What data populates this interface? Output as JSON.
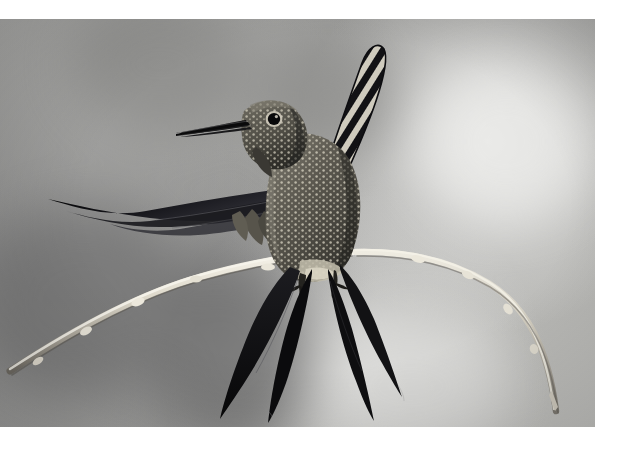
{
  "image": {
    "kind": "photograph",
    "subject": "hummingbird perched on a thin bare twig",
    "orientation": "landscape",
    "palette": "monochrome grayscale",
    "canvas": {
      "width": 624,
      "height": 461,
      "background_color": "#ffffff"
    },
    "photo_frame": {
      "x": 0,
      "y": 19,
      "width": 595,
      "height": 408
    }
  },
  "background": {
    "description": "smooth out-of-focus gray bokeh with soft light and dark patches",
    "base_color": "#a6a6a4",
    "highlight_color": "#ececea",
    "shadow_color": "#6f6f6f",
    "highlight_zones": [
      "upper right",
      "lower center"
    ],
    "shadow_zones": [
      "left",
      "lower left",
      "center bottom"
    ]
  },
  "subject": {
    "name": "hummingbird",
    "pose": "perched with wings raised and spread",
    "body_color": "#4a4842",
    "accent_color": "#0d0d0e",
    "plumage_highlight": "#ded9c8",
    "parts": [
      {
        "label": "beak",
        "note": "long straight needle-like bill pointing left",
        "color": "#121212"
      },
      {
        "label": "eye",
        "note": "round dark eye with pale eyering",
        "color": "#0b0b0b"
      },
      {
        "label": "head",
        "note": "finely speckled crown and cheek",
        "color": "#5a574e"
      },
      {
        "label": "breast",
        "note": "scaled spotted breast and belly",
        "color": "#6a675c"
      },
      {
        "label": "left-wing",
        "note": "long dark wing sweeping far to the left",
        "color": "#151515"
      },
      {
        "label": "right-wing",
        "note": "raised wing with bold zebra banding",
        "color": "#1a1a1a"
      },
      {
        "label": "tail",
        "note": "four long pointed dark tail streamers splayed downward",
        "color": "#101010"
      },
      {
        "label": "feet",
        "note": "small claws gripping the twig",
        "color": "#2a2823"
      }
    ]
  },
  "perch": {
    "label": "twig",
    "description": "thin pale bare branch crossing the frame, arcing down to the left and down to the right",
    "color": "#d9d5c9",
    "highlight_color": "#f2efe6",
    "shadow_color": "#7e7a72"
  }
}
